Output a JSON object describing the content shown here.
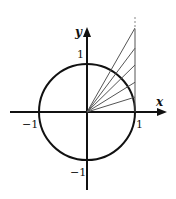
{
  "figure": {
    "axes": {
      "x_label": "x",
      "y_label": "y",
      "tick_labels": {
        "x_pos": "1",
        "x_neg": "−1",
        "y_pos": "1",
        "y_neg": "−1"
      }
    },
    "circle": {
      "description": "unit circle",
      "radius": 1
    },
    "tangent_line": {
      "x": 1,
      "continues_upward": true
    },
    "rays": {
      "from": [
        0,
        0
      ],
      "to_points_on_x_eq_1": [
        0.31,
        0.62,
        0.98,
        1.33,
        1.75
      ]
    },
    "colors": {
      "stroke": "#111111",
      "ray": "#555555"
    }
  }
}
